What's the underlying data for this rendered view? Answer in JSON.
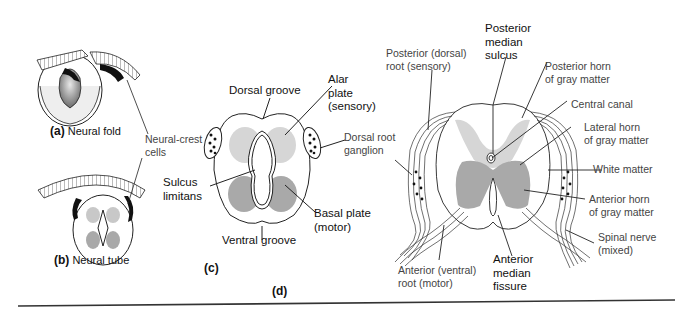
{
  "panels": {
    "a": {
      "letter": "(a)",
      "caption": "Neural fold"
    },
    "b": {
      "letter": "(b)",
      "caption": "Neural tube"
    },
    "c": {
      "letter": "(c)"
    },
    "d": {
      "letter": "(d)"
    }
  },
  "labels": {
    "neural_crest_1": "Neural-crest",
    "neural_crest_2": "cells",
    "dorsal_groove": "Dorsal groove",
    "alar_1": "Alar",
    "alar_2": "plate",
    "alar_3": "(sensory)",
    "drg_1": "Dorsal root",
    "drg_2": "ganglion",
    "sulcus_1": "Sulcus",
    "sulcus_2": "limitans",
    "basal_1": "Basal plate",
    "basal_2": "(motor)",
    "ventral_groove": "Ventral groove",
    "post_root_1": "Posterior (dorsal)",
    "post_root_2": "root (sensory)",
    "post_median_1": "Posterior",
    "post_median_2": "median",
    "post_median_3": "sulcus",
    "post_horn_1": "Posterior horn",
    "post_horn_2": "of gray matter",
    "central_canal": "Central canal",
    "lat_horn_1": "Lateral horn",
    "lat_horn_2": "of gray matter",
    "white_matter": "White matter",
    "ant_horn_1": "Anterior horn",
    "ant_horn_2": "of gray matter",
    "spinal_nerve_1": "Spinal nerve",
    "spinal_nerve_2": "(mixed)",
    "ant_root_1": "Anterior (ventral)",
    "ant_root_2": "root (motor)",
    "ant_median_1": "Anterior",
    "ant_median_2": "median",
    "ant_median_3": "fissure"
  },
  "colors": {
    "light_gray": "#d6d6d6",
    "mid_gray": "#a9a9a9",
    "dark": "#1a1a1a",
    "rule": "#333333"
  }
}
